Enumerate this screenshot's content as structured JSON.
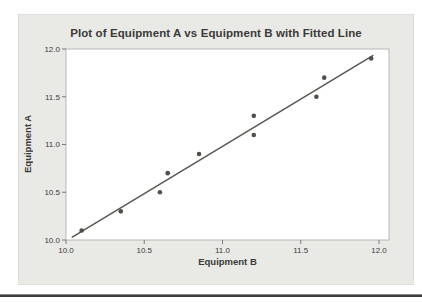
{
  "figure": {
    "title": "Plot of Equipment A vs Equipment B with Fitted Line",
    "xlabel": "Equipment B",
    "ylabel": "Equipment A"
  },
  "chart_data": {
    "type": "scatter",
    "title": "Plot of Equipment A vs Equipment B with Fitted Line",
    "xlabel": "Equipment B",
    "ylabel": "Equipment A",
    "xlim": [
      10.0,
      12.0
    ],
    "ylim": [
      10.0,
      12.0
    ],
    "xticks": [
      10.0,
      10.5,
      11.0,
      11.5,
      12.0
    ],
    "yticks": [
      10.0,
      10.5,
      11.0,
      11.5,
      12.0
    ],
    "grid": false,
    "legend": "none",
    "points": [
      {
        "x": 10.1,
        "y": 10.1
      },
      {
        "x": 10.35,
        "y": 10.3
      },
      {
        "x": 10.6,
        "y": 10.5
      },
      {
        "x": 10.65,
        "y": 10.7
      },
      {
        "x": 10.85,
        "y": 10.9
      },
      {
        "x": 11.2,
        "y": 11.1
      },
      {
        "x": 11.2,
        "y": 11.3
      },
      {
        "x": 11.6,
        "y": 11.5
      },
      {
        "x": 11.65,
        "y": 11.7
      },
      {
        "x": 11.95,
        "y": 11.9
      }
    ],
    "fitted_line": {
      "x1": 10.04,
      "y1": 10.03,
      "x2": 11.96,
      "y2": 11.93
    },
    "colors": {
      "panel_bg": "#e9e9e6",
      "plot_bg": "#ffffff",
      "frame": "#b8b8b6",
      "tick": "#7d7d7b",
      "tick_text": "#3c3c3a",
      "point": "#50504a",
      "line": "#5a5a54",
      "title_text": "#3a3a38"
    }
  }
}
